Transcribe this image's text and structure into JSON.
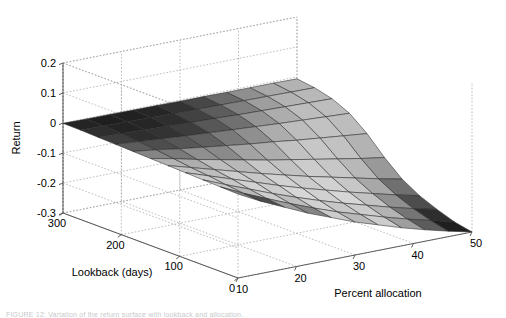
{
  "figure": {
    "background": "#ffffff",
    "caption": "FIGURE 12: Variation of the return surface with lookback and allocation."
  },
  "axes": {
    "z": {
      "label": "Return",
      "ticks": [
        "0.2",
        "0.1",
        "0",
        "-0.1",
        "-0.2",
        "-0.3"
      ],
      "values": [
        0.2,
        0.1,
        0,
        -0.1,
        -0.2,
        -0.3
      ],
      "range": [
        -0.3,
        0.2
      ]
    },
    "y": {
      "label": "Lookback (days)",
      "ticks": [
        "300",
        "200",
        "100",
        "0"
      ],
      "values": [
        300,
        200,
        100,
        0
      ],
      "range": [
        0,
        300
      ]
    },
    "x": {
      "label": "Percent allocation",
      "ticks": [
        "10",
        "20",
        "30",
        "40",
        "50"
      ],
      "values": [
        10,
        20,
        30,
        40,
        50
      ],
      "range": [
        10,
        50
      ]
    },
    "grid": true,
    "grid_style": "dotted",
    "grid_color": "#a0a0a0",
    "axis_color": "#4d4d4d"
  },
  "chart_data": {
    "type": "surface",
    "title": "",
    "xlabel": "Percent allocation",
    "ylabel": "Lookback (days)",
    "zlabel": "Return",
    "xlim": [
      10,
      50
    ],
    "ylim": [
      0,
      300
    ],
    "zlim": [
      -0.3,
      0.2
    ],
    "grid": true,
    "legend": "none",
    "colormap": "gray",
    "x": [
      10,
      14,
      18,
      22,
      26,
      30,
      34,
      38,
      42,
      46,
      50
    ],
    "y": [
      0,
      30,
      60,
      90,
      120,
      150,
      180,
      210,
      240,
      270,
      300
    ],
    "z": [
      [
        -0.02,
        -0.06,
        -0.095,
        -0.13,
        -0.16,
        -0.19,
        -0.215,
        -0.24,
        -0.262,
        -0.282,
        -0.3
      ],
      [
        -0.018,
        -0.055,
        -0.088,
        -0.12,
        -0.15,
        -0.178,
        -0.202,
        -0.226,
        -0.248,
        -0.268,
        -0.288
      ],
      [
        -0.016,
        -0.048,
        -0.078,
        -0.108,
        -0.136,
        -0.162,
        -0.186,
        -0.208,
        -0.23,
        -0.25,
        -0.268
      ],
      [
        -0.014,
        -0.04,
        -0.066,
        -0.092,
        -0.118,
        -0.142,
        -0.164,
        -0.186,
        -0.206,
        -0.226,
        -0.244
      ],
      [
        -0.012,
        -0.034,
        -0.056,
        -0.078,
        -0.1,
        -0.12,
        -0.14,
        -0.158,
        -0.176,
        -0.194,
        -0.21
      ],
      [
        -0.01,
        -0.026,
        -0.044,
        -0.06,
        -0.076,
        -0.092,
        -0.106,
        -0.12,
        -0.134,
        -0.148,
        -0.16
      ],
      [
        -0.008,
        -0.018,
        -0.03,
        -0.04,
        -0.05,
        -0.06,
        -0.068,
        -0.078,
        -0.086,
        -0.094,
        -0.102
      ],
      [
        -0.006,
        -0.012,
        -0.018,
        -0.024,
        -0.029,
        -0.034,
        -0.039,
        -0.044,
        -0.048,
        -0.052,
        -0.056
      ],
      [
        -0.004,
        -0.007,
        -0.01,
        -0.013,
        -0.016,
        -0.018,
        -0.021,
        -0.023,
        -0.025,
        -0.027,
        -0.029
      ],
      [
        -0.002,
        -0.004,
        -0.005,
        -0.006,
        -0.008,
        -0.009,
        -0.01,
        -0.011,
        -0.012,
        -0.013,
        -0.014
      ],
      [
        -0.001,
        -0.002,
        -0.002,
        -0.003,
        -0.003,
        -0.004,
        -0.004,
        -0.005,
        -0.005,
        -0.005,
        -0.006
      ]
    ],
    "shade_rows": [
      [
        0.52,
        0.3,
        0.62,
        0.52,
        0.8,
        0.72,
        0.8,
        0.62,
        0.36,
        0.12
      ],
      [
        0.78,
        0.72,
        0.8,
        0.74,
        0.82,
        0.78,
        0.8,
        0.7,
        0.46,
        0.18
      ],
      [
        0.8,
        0.78,
        0.82,
        0.8,
        0.84,
        0.82,
        0.84,
        0.76,
        0.56,
        0.3
      ],
      [
        0.76,
        0.74,
        0.8,
        0.78,
        0.82,
        0.8,
        0.82,
        0.78,
        0.66,
        0.44
      ],
      [
        0.7,
        0.68,
        0.74,
        0.72,
        0.78,
        0.76,
        0.8,
        0.78,
        0.72,
        0.6
      ],
      [
        0.52,
        0.48,
        0.56,
        0.54,
        0.64,
        0.68,
        0.76,
        0.78,
        0.76,
        0.7
      ],
      [
        0.36,
        0.3,
        0.34,
        0.38,
        0.48,
        0.56,
        0.68,
        0.74,
        0.76,
        0.74
      ],
      [
        0.24,
        0.18,
        0.2,
        0.24,
        0.34,
        0.44,
        0.58,
        0.68,
        0.74,
        0.74
      ],
      [
        0.18,
        0.14,
        0.15,
        0.18,
        0.26,
        0.36,
        0.5,
        0.62,
        0.7,
        0.72
      ],
      [
        0.14,
        0.12,
        0.13,
        0.15,
        0.2,
        0.28,
        0.42,
        0.56,
        0.66,
        0.7
      ]
    ]
  },
  "projection": {
    "origin_px": [
      63,
      213
    ],
    "front_px": [
      238,
      278
    ],
    "right_px": [
      472,
      232
    ],
    "top_px": [
      63,
      63
    ],
    "z_span_px": 150
  }
}
